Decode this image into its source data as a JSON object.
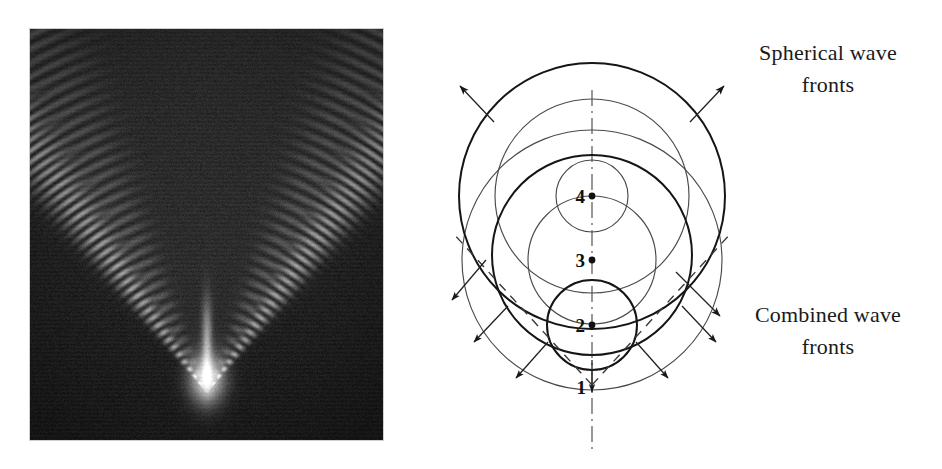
{
  "figure": {
    "kind": "physics-diagram",
    "caption_labels": {
      "spherical": "Spherical wave\nfronts",
      "spherical_line1": "Spherical wave",
      "spherical_line2": "fronts",
      "combined_line1": "Combined wave",
      "combined_line2": "fronts"
    }
  },
  "photo": {
    "name": "shadowgraph-supersonic-projectile",
    "description": "Shadowgraph photograph of a supersonic projectile showing a V shaped Mach cone of shock waves against a dark background",
    "background_color": "#0d0d0d",
    "wave_color": "#b9b9b9",
    "highlight_color": "#f2f2f2"
  },
  "diagram": {
    "axis_color": "#444444",
    "thin_stroke_color": "#4a4a4a",
    "thick_stroke_color": "#151515",
    "center_x": 202,
    "points": [
      {
        "label": "4",
        "cx": 202,
        "cy": 196,
        "radius": 36,
        "weight": "thin"
      },
      {
        "label": "3",
        "cx": 202,
        "cy": 260,
        "radius": 64,
        "weight": "thin"
      },
      {
        "label": "2",
        "cx": 202,
        "cy": 325,
        "radius": 45,
        "weight": "thick"
      },
      {
        "label": "1",
        "cx": 202,
        "cy": 385,
        "radius": 0,
        "weight": "none"
      }
    ],
    "wavefront_circles": [
      {
        "source": "4",
        "cx": 202,
        "cy": 196,
        "r": 36,
        "weight": "thin"
      },
      {
        "source": "3",
        "cx": 202,
        "cy": 260,
        "r": 64,
        "weight": "thin"
      },
      {
        "source": "2",
        "cx": 202,
        "cy": 196,
        "r": 97,
        "weight": "thin"
      },
      {
        "source": "1",
        "cx": 202,
        "cy": 260,
        "r": 130,
        "weight": "thin"
      },
      {
        "source": "combined-inner",
        "cx": 202,
        "cy": 325,
        "r": 45,
        "weight": "thick"
      },
      {
        "source": "combined-mid",
        "cx": 202,
        "cy": 255,
        "r": 100,
        "weight": "thick"
      },
      {
        "source": "combined-outer",
        "cx": 202,
        "cy": 196,
        "r": 133,
        "weight": "thick"
      }
    ],
    "mach_lines": [
      {
        "side": "left",
        "x1": 202,
        "y1": 385,
        "x2": 62,
        "y2": 232
      },
      {
        "side": "right",
        "x1": 202,
        "y1": 385,
        "x2": 342,
        "y2": 232
      }
    ],
    "arrows": [
      {
        "name": "arrow-up-left",
        "x1": 100,
        "y1": 120,
        "x2": 68,
        "y2": 84
      },
      {
        "name": "arrow-up-right",
        "x1": 304,
        "y1": 120,
        "x2": 336,
        "y2": 84
      },
      {
        "name": "arrow-mid-left",
        "x1": 96,
        "y1": 262,
        "x2": 62,
        "y2": 302
      },
      {
        "name": "arrow-mid-right",
        "x1": 308,
        "y1": 262,
        "x2": 342,
        "y2": 302
      },
      {
        "name": "arrow-low-left",
        "x1": 118,
        "y1": 310,
        "x2": 84,
        "y2": 344
      },
      {
        "name": "arrow-low-right",
        "x1": 286,
        "y1": 310,
        "x2": 320,
        "y2": 344
      },
      {
        "name": "arrow-bottom-left",
        "x1": 160,
        "y1": 344,
        "x2": 128,
        "y2": 378
      },
      {
        "name": "arrow-bottom-right",
        "x1": 244,
        "y1": 344,
        "x2": 276,
        "y2": 378
      },
      {
        "name": "arrow-combined-right",
        "x1": 286,
        "y1": 276,
        "x2": 330,
        "y2": 318
      }
    ],
    "axis": {
      "x": 202,
      "y_top": 90,
      "y_bottom": 452
    }
  },
  "labels": {
    "spherical": {
      "line1": "Spherical wave",
      "line2": "fronts",
      "x": 438,
      "y1": 60,
      "y2": 92
    },
    "combined": {
      "line1": "Combined wave",
      "line2": "fronts",
      "x": 438,
      "y1": 322,
      "y2": 354
    }
  },
  "colors": {
    "page_background": "#ffffff",
    "ink": "#1a1a1a",
    "photo_frame": "#cfcfcf"
  }
}
